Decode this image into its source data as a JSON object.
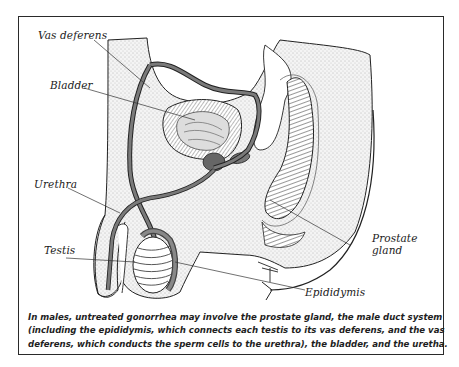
{
  "figure": {
    "labels": {
      "vas_deferens": "Vas deferens",
      "bladder": "Bladder",
      "urethra": "Urethra",
      "testis": "Testis",
      "prostate_line1": "Prostate",
      "prostate_line2": "gland",
      "epididymis": "Epididymis"
    },
    "caption": {
      "line1": "In males, untreated gonorrhea may involve the prostate gland, the male duct system",
      "line2": "(including the epididymis, which connects each testis to its vas deferens, and the vas",
      "line3": "deferens, which conducts the sperm cells to the urethra), the bladder, and the uretha."
    },
    "colors": {
      "ink": "#1e1e1e",
      "duct_gray": "#6b6b6b",
      "stipple_bg": "#f1f1f1",
      "border": "#2a2a2a"
    }
  }
}
